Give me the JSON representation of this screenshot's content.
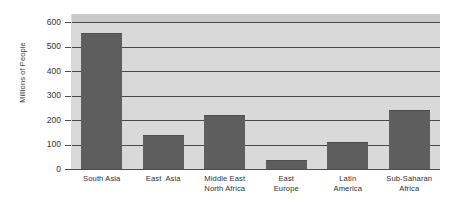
{
  "chart_data": {
    "type": "bar",
    "title": "",
    "xlabel": "",
    "ylabel": "Millions of People",
    "ylim": [
      0,
      600
    ],
    "ytick_step": 100,
    "grid": true,
    "legend": "none",
    "categories": [
      "South Asia",
      "East  Asia",
      "Middle East North Africa",
      "East Europe",
      "Latin America",
      "Sub-Saharan Africa"
    ],
    "category_lines": [
      [
        "South Asia"
      ],
      [
        "East  Asia"
      ],
      [
        "Middle East",
        "North Africa"
      ],
      [
        "East",
        "Europe"
      ],
      [
        "Latin",
        "America"
      ],
      [
        "Sub-Saharan",
        "Africa"
      ]
    ],
    "values": [
      555,
      140,
      220,
      35,
      112,
      240
    ],
    "ytick_labels": [
      "0",
      "100",
      "200",
      "300",
      "400",
      "500",
      "600"
    ],
    "ytick_values": [
      0,
      100,
      200,
      300,
      400,
      500,
      600
    ],
    "colors": {
      "bar_fill": "#5e5e5e",
      "bar_edge": "#4f4f4f",
      "plot_background": "#d9d9d9",
      "headroom_band": "#c9c9c9",
      "gridline": "#4a4a4a",
      "text": "#333333",
      "page_background": "#ffffff"
    }
  }
}
